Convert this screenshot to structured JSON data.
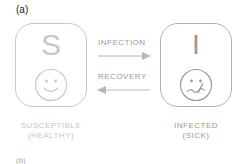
{
  "panel_a_label": "(a)",
  "panel_b_label": "(b)",
  "states": {
    "susceptible": {
      "letter": "S",
      "caption_line1": "SUSCEPTIBLE",
      "caption_line2": "(HEALTHY)",
      "face": "happy-face-icon",
      "color": "#c8c8c8"
    },
    "infected": {
      "letter": "I",
      "caption_line1": "INFECTED",
      "caption_line2": "(SICK)",
      "face": "sick-face-icon",
      "color": "#9a9a9a"
    }
  },
  "transitions": {
    "infection": {
      "label": "INFECTION",
      "direction": "S→I"
    },
    "recovery": {
      "label": "RECOVERY",
      "direction": "I→S"
    }
  }
}
